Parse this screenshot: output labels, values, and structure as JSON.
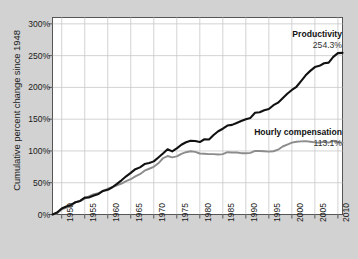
{
  "chart_data": {
    "type": "line",
    "title": "",
    "subtitle": "",
    "xlabel": "",
    "ylabel": "Cumulative percent change since 1948",
    "xlim": [
      1948,
      2011
    ],
    "ylim": [
      0,
      310
    ],
    "grid": true,
    "legend_position": "inline-right",
    "y_ticks": [
      "0%",
      "50%",
      "100%",
      "150%",
      "200%",
      "250%",
      "300%"
    ],
    "y_tick_values": [
      0,
      50,
      100,
      150,
      200,
      250,
      300
    ],
    "x_ticks": [
      "1950",
      "1955",
      "1960",
      "1965",
      "1970",
      "1975",
      "1980",
      "1985",
      "1990",
      "1995",
      "2000",
      "2005",
      "2010"
    ],
    "x_tick_values": [
      1950,
      1955,
      1960,
      1965,
      1970,
      1975,
      1980,
      1985,
      1990,
      1995,
      2000,
      2005,
      2010
    ],
    "annotations": [
      {
        "name": "productivity-end-label",
        "label": "Productivity",
        "value": "254.3%",
        "x": 2011,
        "y": 254.3
      },
      {
        "name": "compensation-end-label",
        "label": "Hourly compensation",
        "value": "113.1%",
        "x": 2011,
        "y": 113.1
      }
    ],
    "series": [
      {
        "name": "Productivity",
        "color": "#111111",
        "end_label": "Productivity",
        "end_value": "254.3%",
        "x": [
          1948,
          1949,
          1950,
          1951,
          1952,
          1953,
          1954,
          1955,
          1956,
          1957,
          1958,
          1959,
          1960,
          1961,
          1962,
          1963,
          1964,
          1965,
          1966,
          1967,
          1968,
          1969,
          1970,
          1971,
          1972,
          1973,
          1974,
          1975,
          1976,
          1977,
          1978,
          1979,
          1980,
          1981,
          1982,
          1983,
          1984,
          1985,
          1986,
          1987,
          1988,
          1989,
          1990,
          1991,
          1992,
          1993,
          1994,
          1995,
          1996,
          1997,
          1998,
          1999,
          2000,
          2001,
          2002,
          2003,
          2004,
          2005,
          2006,
          2007,
          2008,
          2009,
          2010,
          2011
        ],
        "values": [
          0,
          3.1,
          9.5,
          12.5,
          15.1,
          19.3,
          21.4,
          26.5,
          27.0,
          29.8,
          32.3,
          37.1,
          38.8,
          42.9,
          48.2,
          53.8,
          60.1,
          65.5,
          71.3,
          74.2,
          79.4,
          81.0,
          83.6,
          89.8,
          96.0,
          102.6,
          99.3,
          104.0,
          109.8,
          113.7,
          116.1,
          115.6,
          114.0,
          118.4,
          118.0,
          125.0,
          131.0,
          135.0,
          140.0,
          141.0,
          144.0,
          147.0,
          150.0,
          152.0,
          160.0,
          161.0,
          164.0,
          166.0,
          172.0,
          176.0,
          183.0,
          190.0,
          196.0,
          201.0,
          210.0,
          219.0,
          226.0,
          232.0,
          234.0,
          238.0,
          239.0,
          248.0,
          254.0,
          254.3
        ]
      },
      {
        "name": "Hourly compensation",
        "color": "#8c8c8c",
        "end_label": "Hourly compensation",
        "end_value": "113.1%",
        "x": [
          1948,
          1949,
          1950,
          1951,
          1952,
          1953,
          1954,
          1955,
          1956,
          1957,
          1958,
          1959,
          1960,
          1961,
          1962,
          1963,
          1964,
          1965,
          1966,
          1967,
          1968,
          1969,
          1970,
          1971,
          1972,
          1973,
          1974,
          1975,
          1976,
          1977,
          1978,
          1979,
          1980,
          1981,
          1982,
          1983,
          1984,
          1985,
          1986,
          1987,
          1988,
          1989,
          1990,
          1991,
          1992,
          1993,
          1994,
          1995,
          1996,
          1997,
          1998,
          1999,
          2000,
          2001,
          2002,
          2003,
          2004,
          2005,
          2006,
          2007,
          2008,
          2009,
          2010,
          2011
        ],
        "values": [
          0,
          2.0,
          8.0,
          11.0,
          14.0,
          19.5,
          21.0,
          25.0,
          29.0,
          32.0,
          33.5,
          37.5,
          40.5,
          43.0,
          46.0,
          48.5,
          52.5,
          55.5,
          60.0,
          63.5,
          69.0,
          72.0,
          75.0,
          80.5,
          88.5,
          92.0,
          90.0,
          91.5,
          95.5,
          98.0,
          99.5,
          98.5,
          96.0,
          95.5,
          95.0,
          95.0,
          94.5,
          95.0,
          98.0,
          97.5,
          97.5,
          96.5,
          96.5,
          97.0,
          100.0,
          100.0,
          99.5,
          99.0,
          99.5,
          102.0,
          107.0,
          110.0,
          113.0,
          114.5,
          115.0,
          115.5,
          114.5,
          113.5,
          113.0,
          114.5,
          113.0,
          116.0,
          114.0,
          113.1
        ]
      }
    ]
  }
}
